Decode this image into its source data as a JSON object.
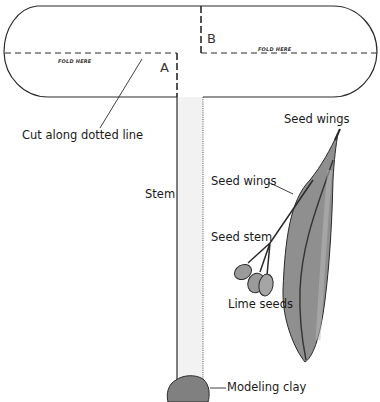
{
  "diagram": {
    "type": "paper helicopter / seed model template",
    "panel_labels": {
      "a": "A",
      "b": "B"
    },
    "fold_labels": {
      "left": "FOLD HERE",
      "right": "FOLD HERE"
    },
    "callouts": {
      "cut": "Cut along dotted line",
      "stem": "Stem",
      "seed_wings_top": "Seed wings",
      "seed_wings_side": "Seed wings",
      "seed_stem": "Seed stem",
      "lime_seeds": "Lime seeds",
      "modeling_clay": "Modeling clay"
    },
    "colors": {
      "outline": "#2a2a2a",
      "stem_fill": "#f2f2f2",
      "wing_fill": "#8f8f8f",
      "wing_light": "#b5b5b5",
      "seed_fill": "#9a9a9a",
      "clay_fill": "#808080"
    }
  }
}
